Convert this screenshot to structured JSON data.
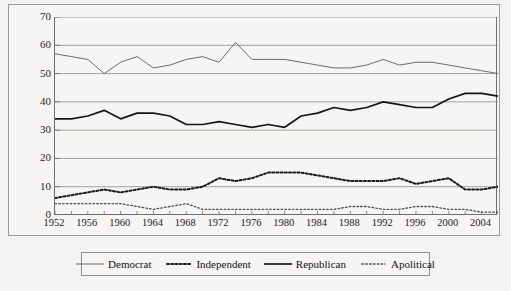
{
  "chart_data": {
    "type": "line",
    "title": "",
    "xlabel": "",
    "ylabel": "",
    "xlim": [
      1952,
      2006
    ],
    "ylim": [
      0,
      70
    ],
    "ytick_step": 10,
    "yticks": [
      0,
      10,
      20,
      30,
      40,
      50,
      60,
      70
    ],
    "xticks_labeled": [
      1952,
      1956,
      1960,
      1964,
      1968,
      1972,
      1976,
      1980,
      1984,
      1988,
      1992,
      1996,
      2000,
      2004
    ],
    "xtick_minor_step": 2,
    "grid": "horizontal",
    "legend_position": "below",
    "x": [
      1952,
      1954,
      1956,
      1958,
      1960,
      1962,
      1964,
      1966,
      1968,
      1970,
      1972,
      1974,
      1976,
      1978,
      1980,
      1982,
      1984,
      1986,
      1988,
      1990,
      1992,
      1994,
      1996,
      1998,
      2000,
      2002,
      2004,
      2006
    ],
    "series": [
      {
        "name": "Democrat",
        "style": "solid-thin",
        "color": "#6b6b69",
        "values": [
          57,
          56,
          55,
          50,
          54,
          56,
          52,
          53,
          55,
          56,
          54,
          61,
          55,
          55,
          55,
          54,
          53,
          52,
          52,
          53,
          55,
          53,
          54,
          54,
          53,
          52,
          51,
          50
        ]
      },
      {
        "name": "Independent",
        "style": "dotted-bold",
        "color": "#1b1b1b",
        "values": [
          6,
          7,
          8,
          9,
          8,
          9,
          10,
          9,
          9,
          10,
          13,
          12,
          13,
          15,
          15,
          15,
          14,
          13,
          12,
          12,
          12,
          13,
          11,
          12,
          13,
          9,
          9,
          10
        ]
      },
      {
        "name": "Republican",
        "style": "solid-bold",
        "color": "#161616",
        "values": [
          34,
          34,
          35,
          37,
          34,
          36,
          36,
          35,
          32,
          32,
          33,
          32,
          31,
          32,
          31,
          35,
          36,
          38,
          37,
          38,
          40,
          39,
          38,
          38,
          41,
          43,
          43,
          42
        ]
      },
      {
        "name": "Apolitical",
        "style": "dotted-light",
        "color": "#4e4e4c",
        "values": [
          4,
          4,
          4,
          4,
          4,
          3,
          2,
          3,
          4,
          2,
          2,
          2,
          2,
          2,
          2,
          2,
          2,
          2,
          3,
          3,
          2,
          2,
          3,
          3,
          2,
          2,
          1,
          1
        ]
      }
    ]
  },
  "legend": {
    "items": [
      {
        "label": "Democrat"
      },
      {
        "label": "Independent"
      },
      {
        "label": "Republican"
      },
      {
        "label": "Apolitical"
      }
    ]
  }
}
